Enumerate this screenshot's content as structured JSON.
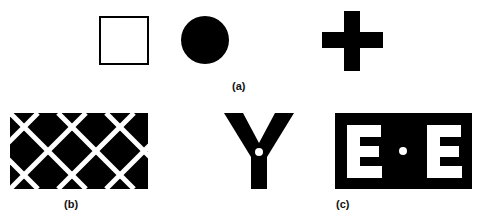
{
  "panels": {
    "a": {
      "label": "(a)",
      "shapes": [
        "outlined-square",
        "filled-circle",
        "plus-sign"
      ]
    },
    "b": {
      "label": "(b)",
      "pattern": "black-rectangle-with-white-diagonal-lattice"
    },
    "c": {
      "label": "(c)",
      "left_letter": "Y",
      "right_text": "E · E"
    }
  },
  "colors": {
    "ink": "#000000",
    "paper": "#ffffff"
  }
}
